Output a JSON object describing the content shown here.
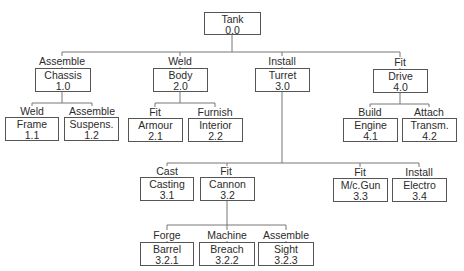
{
  "diagram": {
    "type": "work-breakdown-tree",
    "root": {
      "name": "Tank",
      "code": "0.0"
    },
    "nodes": {
      "n00": {
        "verb": "",
        "name": "Tank",
        "code": "0.0"
      },
      "n10": {
        "verb": "Assemble",
        "name": "Chassis",
        "code": "1.0"
      },
      "n20": {
        "verb": "Weld",
        "name": "Body",
        "code": "2.0"
      },
      "n30": {
        "verb": "Install",
        "name": "Turret",
        "code": "3.0"
      },
      "n40": {
        "verb": "Fit",
        "name": "Drive",
        "code": "4.0"
      },
      "n11": {
        "verb": "Weld",
        "name": "Frame",
        "code": "1.1"
      },
      "n12": {
        "verb": "Assemble",
        "name": "Suspens.",
        "code": "1.2"
      },
      "n21": {
        "verb": "Fit",
        "name": "Armour",
        "code": "2.1"
      },
      "n22": {
        "verb": "Furnish",
        "name": "Interior",
        "code": "2.2"
      },
      "n41": {
        "verb": "Build",
        "name": "Engine",
        "code": "4.1"
      },
      "n42": {
        "verb": "Attach",
        "name": "Transm.",
        "code": "4.2"
      },
      "n31": {
        "verb": "Cast",
        "name": "Casting",
        "code": "3.1"
      },
      "n32": {
        "verb": "Fit",
        "name": "Cannon",
        "code": "3.2"
      },
      "n33": {
        "verb": "Fit",
        "name": "M/c.Gun",
        "code": "3.3"
      },
      "n34": {
        "verb": "Install",
        "name": "Electro",
        "code": "3.4"
      },
      "n321": {
        "verb": "Forge",
        "name": "Barrel",
        "code": "3.2.1"
      },
      "n322": {
        "verb": "Machine",
        "name": "Breach",
        "code": "3.2.2"
      },
      "n323": {
        "verb": "Assemble",
        "name": "Sight",
        "code": "3.2.3"
      }
    },
    "edges": [
      [
        "0.0",
        "1.0"
      ],
      [
        "0.0",
        "2.0"
      ],
      [
        "0.0",
        "3.0"
      ],
      [
        "0.0",
        "4.0"
      ],
      [
        "1.0",
        "1.1"
      ],
      [
        "1.0",
        "1.2"
      ],
      [
        "2.0",
        "2.1"
      ],
      [
        "2.0",
        "2.2"
      ],
      [
        "4.0",
        "4.1"
      ],
      [
        "4.0",
        "4.2"
      ],
      [
        "3.0",
        "3.1"
      ],
      [
        "3.0",
        "3.2"
      ],
      [
        "3.0",
        "3.3"
      ],
      [
        "3.0",
        "3.4"
      ],
      [
        "3.2",
        "3.2.1"
      ],
      [
        "3.2",
        "3.2.2"
      ],
      [
        "3.2",
        "3.2.3"
      ]
    ]
  }
}
